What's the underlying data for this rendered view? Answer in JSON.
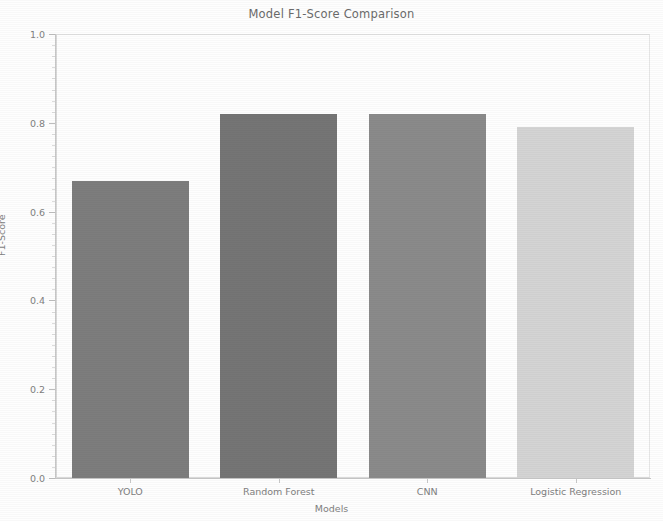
{
  "chart_data": {
    "type": "bar",
    "title": "Model F1-Score Comparison",
    "xlabel": "Models",
    "ylabel": "F1-Score",
    "categories": [
      "YOLO",
      "Random Forest",
      "CNN",
      "Logistic Regression"
    ],
    "values": [
      0.67,
      0.82,
      0.82,
      0.79
    ],
    "bar_colors": [
      "#7d7d7d",
      "#757575",
      "#8a8a8a",
      "#d4d4d4"
    ],
    "ylim": [
      0.0,
      1.0
    ],
    "xlim": [
      -0.5,
      3.5
    ],
    "ytick_labels": [
      "0.0",
      "0.2",
      "0.4",
      "0.6",
      "0.8",
      "1.0"
    ],
    "ytick_values": [
      0.0,
      0.2,
      0.4,
      0.6,
      0.8,
      1.0
    ],
    "grid": false,
    "legend": null,
    "legend_position": "none",
    "background_color": "#ffffff",
    "axis_color": "#c8c8c8",
    "text_color": "#6a6a6a"
  }
}
